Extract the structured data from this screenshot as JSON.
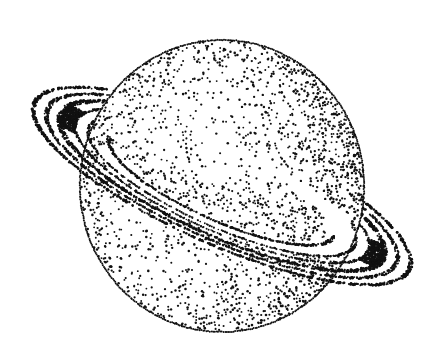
{
  "illustration": {
    "subject": "Saturn (stippled ink drawing)",
    "style": "black stipple dots on white",
    "colors": {
      "ink": "#111111",
      "paper": "#ffffff"
    },
    "planet": {
      "cx": 222,
      "cy": 186,
      "rx": 142,
      "ry": 146
    },
    "ring": {
      "cx": 222,
      "cy": 186,
      "rx": 205,
      "ry": 58,
      "angle": 24
    }
  }
}
